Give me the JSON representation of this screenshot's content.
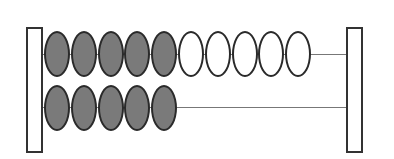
{
  "abacus": {
    "colors": {
      "filled": "#7a7a7a",
      "empty": "#ffffff",
      "outline": "#2a2a2a",
      "rod": "#777777"
    },
    "rows": [
      {
        "beads": [
          "filled",
          "filled",
          "filled",
          "filled",
          "filled",
          "empty",
          "empty",
          "empty",
          "empty",
          "empty"
        ],
        "filled_count": 5,
        "empty_count": 5
      },
      {
        "beads": [
          "filled",
          "filled",
          "filled",
          "filled",
          "filled"
        ],
        "filled_count": 5,
        "empty_count": 0
      }
    ],
    "total_filled": 10
  }
}
